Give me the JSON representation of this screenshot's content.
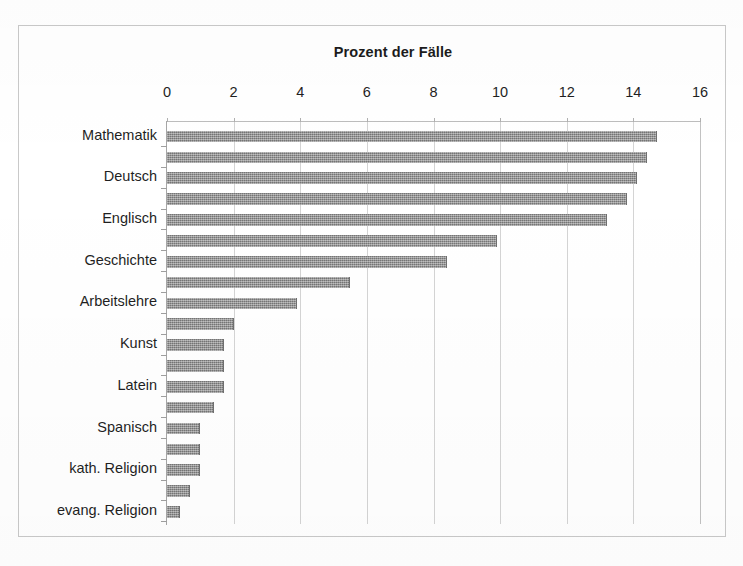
{
  "figure": {
    "title": "Prozent der Fälle",
    "frame_color": "#c9c9c9",
    "background": "#ffffff"
  },
  "chart_data": {
    "type": "bar",
    "orientation": "horizontal",
    "title": "Prozent der Fälle",
    "xlabel": "Prozent der Fälle",
    "ylabel": "",
    "xlim": [
      0,
      16
    ],
    "xticks": [
      0,
      2,
      4,
      6,
      8,
      10,
      12,
      14,
      16
    ],
    "xtick_labels": [
      "0",
      "2",
      "4",
      "6",
      "8",
      "10",
      "12",
      "14",
      "16"
    ],
    "grid": "vertical",
    "legend": "none",
    "bar_color": "#8d8d8d",
    "note": "Only every other category carries a visible axis label in the scan; unlabeled categories are listed with an empty label.",
    "categories": [
      "Mathematik",
      "",
      "Deutsch",
      "",
      "Englisch",
      "",
      "Geschichte",
      "",
      "Arbeitslehre",
      "",
      "Kunst",
      "",
      "Latein",
      "",
      "Spanisch",
      "",
      "kath. Religion",
      "",
      "evang. Religion"
    ],
    "values": [
      14.7,
      14.4,
      14.1,
      13.8,
      13.2,
      9.9,
      8.4,
      5.5,
      3.9,
      2.0,
      1.7,
      1.7,
      1.7,
      1.4,
      1.0,
      1.0,
      1.0,
      0.7,
      0.4
    ],
    "labeled_categories": [
      "Mathematik",
      "Deutsch",
      "Englisch",
      "Geschichte",
      "Arbeitslehre",
      "Kunst",
      "Latein",
      "Spanisch",
      "kath. Religion",
      "evang. Religion"
    ]
  }
}
